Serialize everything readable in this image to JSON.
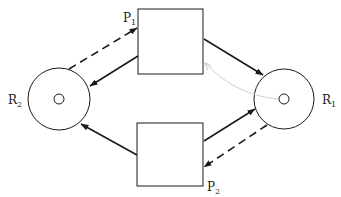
{
  "diagram": {
    "type": "petri-net-resource-deadlock",
    "colors": {
      "stroke": "#1a1a1a",
      "faint_arc": "#cfcfcf",
      "caption": "#d6d6d6"
    },
    "places": [
      {
        "id": "R2",
        "label": "R",
        "subscript": "2",
        "cx": 59,
        "cy": 99,
        "r": 31,
        "inner_r": 5
      },
      {
        "id": "R1",
        "label": "R",
        "subscript": "1",
        "cx": 284,
        "cy": 99,
        "r": 30,
        "inner_r": 5
      }
    ],
    "transitions": [
      {
        "id": "P1",
        "label": "P",
        "subscript": "1",
        "x": 138,
        "y": 9,
        "w": 65,
        "h": 65
      },
      {
        "id": "P2",
        "label": "P",
        "subscript": "2",
        "x": 137,
        "y": 123,
        "w": 66,
        "h": 63
      }
    ],
    "arcs": [
      {
        "id": "R2-to-P1",
        "style": "dashed",
        "from": "R2",
        "to": "P1"
      },
      {
        "id": "P1-to-R2",
        "style": "solid",
        "from": "P1",
        "to": "R2"
      },
      {
        "id": "P1-to-R1",
        "style": "solid",
        "from": "P1",
        "to": "R1"
      },
      {
        "id": "R1-to-P1-faint",
        "style": "faint-curve",
        "from": "R1",
        "to": "P1"
      },
      {
        "id": "P2-to-R2",
        "style": "solid",
        "from": "P2",
        "to": "R2"
      },
      {
        "id": "P2-to-R1",
        "style": "solid",
        "from": "P2",
        "to": "R1"
      },
      {
        "id": "R1-to-P2",
        "style": "dashed",
        "from": "R1",
        "to": "P2"
      }
    ]
  }
}
